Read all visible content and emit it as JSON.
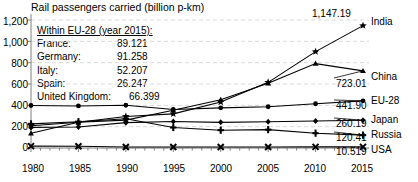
{
  "chart_data": {
    "type": "line",
    "title": "Rail passengers carried (billion p-km)",
    "xlabel": "",
    "ylabel": "",
    "xlim": [
      1980,
      2015
    ],
    "ylim": [
      0,
      1200
    ],
    "grid": true,
    "legend_position": "right-inline",
    "x_ticks": [
      "1980",
      "1985",
      "1990",
      "1995",
      "2000",
      "2005",
      "2010",
      "2015"
    ],
    "y_ticks": [
      "0",
      "200",
      "400",
      "600",
      "800",
      "1,000",
      "1,200"
    ],
    "x": [
      1980,
      1985,
      1990,
      1995,
      2000,
      2005,
      2010,
      2015
    ],
    "series": [
      {
        "name": "India",
        "marker": "star",
        "end_value": "1,147.19",
        "values": [
          208.6,
          241.0,
          295.6,
          320.0,
          430.7,
          615.6,
          903.5,
          1147.19
        ]
      },
      {
        "name": "China",
        "marker": "triangle",
        "end_value": "723.01",
        "values": [
          138.4,
          241.6,
          261.3,
          354.6,
          453.1,
          606.2,
          791.2,
          723.01
        ]
      },
      {
        "name": "EU-28",
        "marker": "circle",
        "end_value": "441.90",
        "values": [
          398.6,
          394.0,
          400.8,
          361.0,
          376.2,
          386.8,
          415.0,
          441.9
        ]
      },
      {
        "name": "Japan",
        "marker": "diamond",
        "end_value": "260.19",
        "values": [
          193.1,
          197.5,
          237.7,
          248.7,
          240.7,
          245.9,
          253.6,
          260.19
        ]
      },
      {
        "name": "Russia",
        "marker": "plus",
        "end_value": "120.41",
        "values": [
          226.0,
          246.5,
          274.4,
          192.2,
          167.1,
          172.2,
          138.9,
          120.41
        ]
      },
      {
        "name": "USA",
        "marker": "x",
        "end_value": "10.519",
        "values": [
          17.6,
          17.0,
          9.9,
          9.0,
          8.9,
          9.1,
          10.5,
          10.519
        ]
      }
    ],
    "annotations": {
      "india_peak_label": "1,147.19"
    }
  },
  "legend": {
    "heading": "Within EU-28 (year 2015):",
    "rows": [
      {
        "country": "France:",
        "value": "89.121"
      },
      {
        "country": "Germany:",
        "value": "91.258"
      },
      {
        "country": "Italy:",
        "value": "52.207"
      },
      {
        "country": "Spain:",
        "value": "26.247"
      },
      {
        "country": "United Kingdom:",
        "value": "66.399"
      }
    ]
  },
  "colors": {
    "line": "#000000",
    "grid": "#d9d9d9",
    "axis": "#808080",
    "background": "#ffffff"
  }
}
